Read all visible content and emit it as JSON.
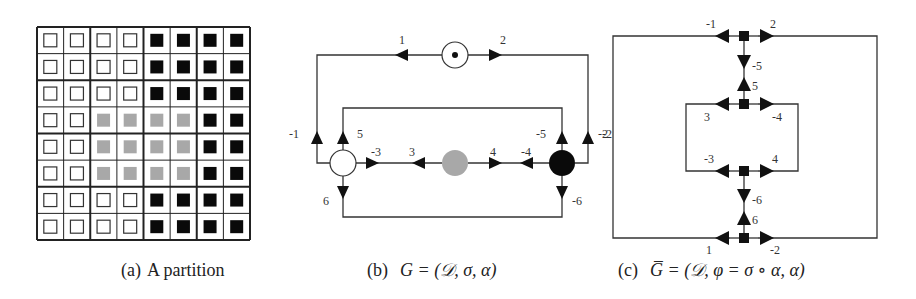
{
  "panels": {
    "a": {
      "caption_tag": "(a)",
      "caption_text": "A partition",
      "grid": {
        "rows": 8,
        "cols": 8,
        "cells": [
          [
            "w",
            "w",
            "w",
            "w",
            "b",
            "b",
            "b",
            "b"
          ],
          [
            "w",
            "w",
            "w",
            "w",
            "b",
            "b",
            "b",
            "b"
          ],
          [
            "w",
            "w",
            "w",
            "w",
            "b",
            "b",
            "b",
            "b"
          ],
          [
            "w",
            "w",
            "g",
            "g",
            "g",
            "g",
            "b",
            "b"
          ],
          [
            "w",
            "w",
            "g",
            "g",
            "g",
            "g",
            "b",
            "b"
          ],
          [
            "w",
            "w",
            "g",
            "g",
            "g",
            "g",
            "b",
            "b"
          ],
          [
            "w",
            "w",
            "w",
            "w",
            "b",
            "b",
            "b",
            "b"
          ],
          [
            "w",
            "w",
            "w",
            "w",
            "b",
            "b",
            "b",
            "b"
          ]
        ]
      }
    },
    "b": {
      "caption_tag": "(b)",
      "caption_math": "G = (𝒟, σ, α)",
      "nodes": [
        {
          "id": "top",
          "style": "dotted-white"
        },
        {
          "id": "white",
          "style": "white"
        },
        {
          "id": "gray",
          "style": "gray"
        },
        {
          "id": "black",
          "style": "black"
        }
      ],
      "dart_labels": {
        "d1": "1",
        "d2": "2",
        "dm1": "-1",
        "dm2": "-2",
        "d5": "5",
        "dm5": "-5",
        "dm3": "-3",
        "d3": "3",
        "d4": "4",
        "dm4": "-4",
        "d6": "6",
        "dm6": "-6"
      }
    },
    "c": {
      "caption_tag": "(c)",
      "caption_math": "G̅ = (𝒟, φ = σ ∘ α, α)",
      "dart_labels": {
        "dm1": "-1",
        "d2": "2",
        "dm5": "-5",
        "d5": "5",
        "d3": "3",
        "dm4": "-4",
        "dm3": "-3",
        "d4": "4",
        "dm6": "-6",
        "d6": "6",
        "d1": "1",
        "dm2": "-2",
        "left": "-2"
      }
    }
  },
  "colors": {
    "ink": "#111111",
    "line": "#333333",
    "gray_fill": "#a8a8a8",
    "black_fill": "#0a0a0a",
    "white_fill": "#ffffff"
  }
}
